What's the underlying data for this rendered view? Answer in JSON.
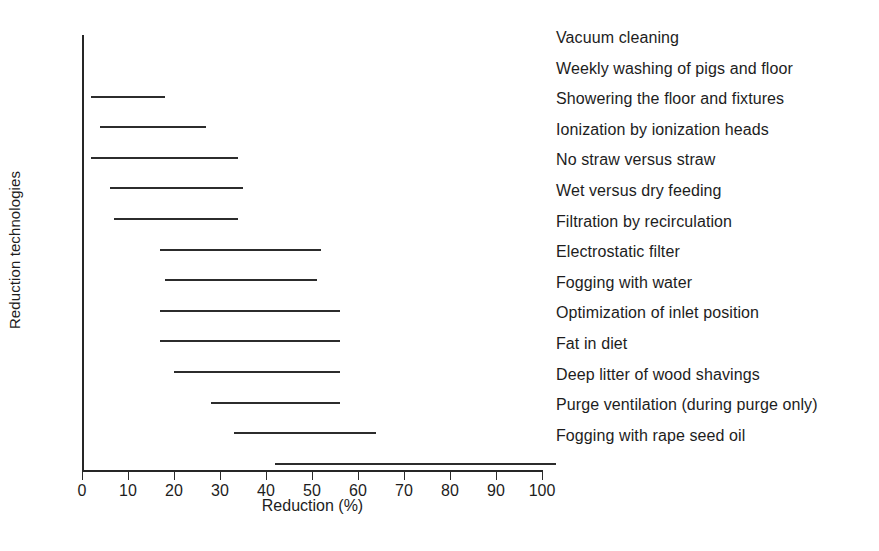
{
  "chart_data": {
    "type": "bar",
    "subtype": "range-bar",
    "title": "",
    "xlabel": "Reduction (%)",
    "ylabel": "Reduction technologies",
    "xlim": [
      0,
      100
    ],
    "xticks": [
      0,
      10,
      20,
      30,
      40,
      50,
      60,
      70,
      80,
      90,
      100
    ],
    "grid": false,
    "legend": "none",
    "categories": [
      "Vacuum cleaning",
      "Weekly washing of pigs and floor",
      "Showering the floor and fixtures",
      "Ionization by ionization heads",
      "No straw versus straw",
      "Wet versus dry feeding",
      "Filtration by recirculation",
      "Electrostatic filter",
      "Fogging with water",
      "Optimization of inlet position",
      "Fat in diet",
      "Deep litter of wood shavings",
      "Purge ventilation (during purge only)",
      "Fogging with rape seed oil"
    ],
    "ranges": [
      {
        "label": "Vacuum cleaning",
        "low": null,
        "high": null
      },
      {
        "label": "Weekly washing of pigs and floor",
        "low": 2,
        "high": 18
      },
      {
        "label": "Showering the floor and fixtures",
        "low": 4,
        "high": 27
      },
      {
        "label": "Ionization by ionization heads",
        "low": 2,
        "high": 34
      },
      {
        "label": "No straw versus straw",
        "low": 6,
        "high": 35
      },
      {
        "label": "Wet versus dry feeding",
        "low": 7,
        "high": 34
      },
      {
        "label": "Filtration by recirculation",
        "low": 17,
        "high": 52
      },
      {
        "label": "Electrostatic filter",
        "low": 18,
        "high": 51
      },
      {
        "label": "Fogging with water",
        "low": 17,
        "high": 56
      },
      {
        "label": "Optimization of inlet position",
        "low": 17,
        "high": 56
      },
      {
        "label": "Fat in diet",
        "low": 20,
        "high": 56
      },
      {
        "label": "Deep litter of wood shavings",
        "low": 28,
        "high": 56
      },
      {
        "label": "Purge ventilation (during purge only)",
        "low": 33,
        "high": 64
      },
      {
        "label": "Fogging with rape seed oil",
        "low": 42,
        "high": 100
      }
    ],
    "colors": {
      "bar": "#2c2c2c",
      "axis": "#262626",
      "text": "#1d1d1d",
      "background": "#ffffff"
    }
  }
}
